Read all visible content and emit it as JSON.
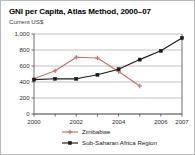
{
  "title": "GNI per Capita, Atlas Method, 2000–07",
  "subtitle": "Current US$",
  "colors": {
    "zimbabwe": "#c9705f",
    "ssa": "#1a1a1a",
    "grid": "#a8a8a8",
    "axis": "#4d4d4d",
    "border": "#b9b9b9",
    "text": "#000000"
  },
  "chart_data": {
    "type": "line",
    "title": "GNI per Capita, Atlas Method, 2000–07",
    "subtitle": "Current US$",
    "xlabel": "",
    "ylabel": "Current US$",
    "x": [
      2000,
      2001,
      2002,
      2003,
      2004,
      2005,
      2006,
      2007
    ],
    "xlim": [
      2000,
      2007
    ],
    "ylim": [
      0,
      1000
    ],
    "yticks": [
      0,
      200,
      400,
      600,
      800,
      1000
    ],
    "ytick_labels": [
      "0",
      "200",
      "400",
      "600",
      "800",
      "1,000"
    ],
    "xtick_values": [
      2000,
      2002,
      2004,
      2006,
      2007
    ],
    "xtick_labels": [
      "2000",
      "2002",
      "2004",
      "2006",
      "2007"
    ],
    "grid": true,
    "legend_position": "bottom",
    "series": [
      {
        "name": "Zimbabwe",
        "color": "#c9705f",
        "marker": "plus",
        "x": [
          2000,
          2001,
          2002,
          2003,
          2004,
          2005
        ],
        "values": [
          440,
          540,
          710,
          700,
          530,
          350
        ]
      },
      {
        "name": "Sub-Saharan Africa Region",
        "color": "#1a1a1a",
        "marker": "square",
        "x": [
          2000,
          2001,
          2002,
          2003,
          2004,
          2005,
          2006,
          2007
        ],
        "values": [
          430,
          440,
          440,
          490,
          560,
          680,
          790,
          950
        ]
      }
    ]
  },
  "legend": [
    {
      "label": "Zimbabwe"
    },
    {
      "label": "Sub-Saharan Africa Region"
    }
  ]
}
